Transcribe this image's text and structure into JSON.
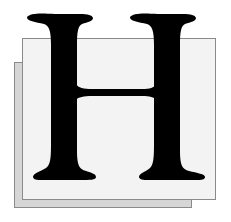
{
  "drop_cap": {
    "letter": "H",
    "letter_color": "#000000",
    "front_square_color": "#f3f3f3",
    "back_square_color": "#d6d6d6",
    "border_color": "#8a8a8a"
  }
}
